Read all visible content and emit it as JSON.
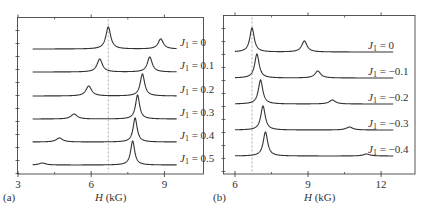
{
  "chart_data": [
    {
      "type": "line",
      "panel": "(a)",
      "title": "",
      "xlabel": "H (kG)",
      "ylabel": "",
      "xlim": [
        3,
        10.7
      ],
      "xticks": [
        3,
        6,
        9
      ],
      "x_minor_ticks": [
        4.5,
        7.5
      ],
      "grid": false,
      "reference_line": {
        "x": 6.7,
        "style": "dashed"
      },
      "x_range_curves": [
        3.6,
        9.5
      ],
      "series": [
        {
          "name": "J1 = 0",
          "label_main": "J",
          "sub": "1",
          "value": " = 0",
          "peaks": [
            {
              "H": 6.7,
              "height": 22,
              "width": 0.12
            },
            {
              "H": 8.85,
              "height": 10,
              "width": 0.13
            }
          ]
        },
        {
          "name": "J1 = 0.1",
          "label_main": "J",
          "sub": "1",
          "value": " = 0.1",
          "peaks": [
            {
              "H": 6.35,
              "height": 13,
              "width": 0.13
            },
            {
              "H": 8.4,
              "height": 15,
              "width": 0.12
            }
          ]
        },
        {
          "name": "J1 = 0.2",
          "label_main": "J",
          "sub": "1",
          "value": " = 0.2",
          "peaks": [
            {
              "H": 5.9,
              "height": 10,
              "width": 0.14
            },
            {
              "H": 8.1,
              "height": 22,
              "width": 0.11
            }
          ]
        },
        {
          "name": "J1 = 0.3",
          "label_main": "J",
          "sub": "1",
          "value": " = 0.3",
          "peaks": [
            {
              "H": 5.3,
              "height": 5,
              "width": 0.15
            },
            {
              "H": 7.9,
              "height": 24,
              "width": 0.1
            }
          ]
        },
        {
          "name": "J1 = 0.4",
          "label_main": "J",
          "sub": "1",
          "value": " = 0.4",
          "peaks": [
            {
              "H": 4.7,
              "height": 4,
              "width": 0.16
            },
            {
              "H": 7.8,
              "height": 24,
              "width": 0.1
            }
          ]
        },
        {
          "name": "J1 = 0.5",
          "label_main": "J",
          "sub": "1",
          "value": " = 0.5",
          "peaks": [
            {
              "H": 4.0,
              "height": 2,
              "width": 0.16
            },
            {
              "H": 7.7,
              "height": 24,
              "width": 0.1
            }
          ]
        }
      ]
    },
    {
      "type": "line",
      "panel": "(b)",
      "title": "",
      "xlabel": "H (kG)",
      "ylabel": "",
      "xlim": [
        5.5,
        13.4
      ],
      "xticks": [
        6,
        9,
        12
      ],
      "x_minor_ticks": [
        7.5,
        10.5
      ],
      "grid": false,
      "reference_line": {
        "x": 6.7,
        "style": "dashed"
      },
      "x_range_curves": [
        6.0,
        12.5
      ],
      "series": [
        {
          "name": "J1 = 0",
          "label_main": "J",
          "sub": "1",
          "value": " = 0",
          "peaks": [
            {
              "H": 6.7,
              "height": 24,
              "width": 0.11
            },
            {
              "H": 8.85,
              "height": 11,
              "width": 0.13
            }
          ]
        },
        {
          "name": "J1 = -0.1",
          "label_main": "J",
          "sub": "1",
          "value": " = −0.1",
          "peaks": [
            {
              "H": 6.9,
              "height": 24,
              "width": 0.11
            },
            {
              "H": 9.4,
              "height": 7,
              "width": 0.14
            }
          ]
        },
        {
          "name": "J1 = -0.2",
          "label_main": "J",
          "sub": "1",
          "value": " = −0.2",
          "peaks": [
            {
              "H": 7.05,
              "height": 24,
              "width": 0.11
            },
            {
              "H": 10.0,
              "height": 4,
              "width": 0.15
            }
          ]
        },
        {
          "name": "J1 = -0.3",
          "label_main": "J",
          "sub": "1",
          "value": " = −0.3",
          "peaks": [
            {
              "H": 7.15,
              "height": 24,
              "width": 0.11
            },
            {
              "H": 10.7,
              "height": 3,
              "width": 0.16
            }
          ]
        },
        {
          "name": "J1 = -0.4",
          "label_main": "J",
          "sub": "1",
          "value": " = −0.4",
          "peaks": [
            {
              "H": 7.25,
              "height": 24,
              "width": 0.11
            },
            {
              "H": 11.4,
              "height": 2,
              "width": 0.16
            }
          ]
        }
      ]
    }
  ],
  "panels": {
    "a": {
      "label": "(a)",
      "xlabel_italic": "H",
      "xlabel_rest": " (kG)",
      "ticks": [
        "3",
        "6",
        "9"
      ]
    },
    "b": {
      "label": "(b)",
      "xlabel_italic": "H",
      "xlabel_rest": " (kG)",
      "ticks": [
        "6",
        "9",
        "12"
      ]
    }
  },
  "colors": {
    "curve": "#333333",
    "frame": "#444444",
    "dashed": "#999999",
    "text": "#333333"
  }
}
